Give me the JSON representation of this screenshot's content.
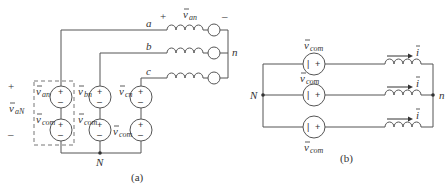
{
  "diagram_a": {
    "caption": "(a)",
    "line_labels": [
      "a",
      "b",
      "c"
    ],
    "top_voltage": {
      "symbol": "v",
      "sub": "an",
      "plus": "+",
      "minus": "–"
    },
    "neutral_right": "n",
    "neutral_bottom": "N",
    "sources_top": [
      {
        "symbol": "v",
        "sub": "an"
      },
      {
        "symbol": "v",
        "sub": "bn"
      },
      {
        "symbol": "v",
        "sub": "cn"
      }
    ],
    "sources_bottom": [
      {
        "symbol": "v",
        "sub": "com"
      },
      {
        "symbol": "v",
        "sub": "com"
      },
      {
        "symbol": "v",
        "sub": "com"
      }
    ],
    "left_voltage": {
      "symbol": "v",
      "sub": "aN",
      "plus": "+",
      "minus": "–"
    },
    "source_plus": "+",
    "source_minus": "–"
  },
  "diagram_b": {
    "caption": "(b)",
    "node_left": "N",
    "node_right": "n",
    "sources": [
      {
        "symbol": "v",
        "sub": "com"
      },
      {
        "symbol": "v",
        "sub": "com"
      },
      {
        "symbol": "v",
        "sub": "com"
      }
    ],
    "currents": [
      "i",
      "i",
      "i"
    ],
    "source_inner_left": "|",
    "source_inner_right": "+"
  }
}
